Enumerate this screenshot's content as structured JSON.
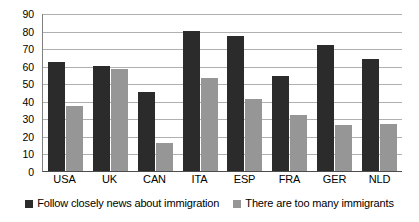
{
  "chart_data": {
    "type": "bar",
    "title": "",
    "subtitle": "",
    "xlabel": "",
    "ylabel": "",
    "ylim": [
      0,
      90
    ],
    "ytick_step": 10,
    "yticks": [
      0,
      10,
      20,
      30,
      40,
      50,
      60,
      70,
      80,
      90
    ],
    "grid": true,
    "legend_position": "bottom",
    "categories": [
      "USA",
      "UK",
      "CAN",
      "ITA",
      "ESP",
      "FRA",
      "GER",
      "NLD"
    ],
    "series": [
      {
        "name": "Follow closely news about immigration",
        "color": "#2b2b2b",
        "values": [
          62,
          60,
          45,
          80,
          77,
          54,
          72,
          64
        ]
      },
      {
        "name": "There are too many immigrants",
        "color": "#969696",
        "values": [
          37,
          58,
          16,
          53,
          41,
          32,
          26,
          27
        ]
      }
    ]
  },
  "axes": {
    "y_tick_labels": [
      "90",
      "80",
      "70",
      "60",
      "50",
      "40",
      "30",
      "20",
      "10",
      "0"
    ],
    "x_tick_labels": [
      "USA",
      "UK",
      "CAN",
      "ITA",
      "ESP",
      "FRA",
      "GER",
      "NLD"
    ]
  },
  "legend": {
    "items": [
      {
        "label": "Follow closely news about immigration",
        "color": "#2b2b2b"
      },
      {
        "label": "There are too many immigrants",
        "color": "#969696"
      }
    ]
  },
  "colors": {
    "series_dark": "#2b2b2b",
    "series_light": "#969696",
    "gridline": "#b0b0b0",
    "axis": "#4d4d4d",
    "background": "#ffffff"
  }
}
